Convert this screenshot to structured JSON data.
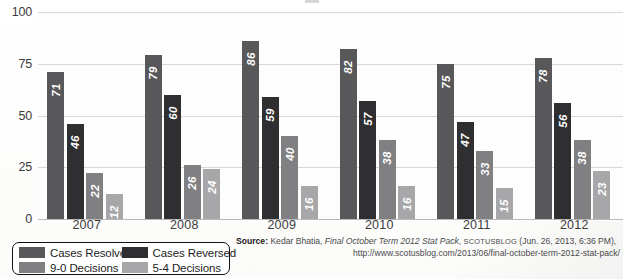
{
  "chart_data": {
    "type": "bar",
    "title": "",
    "xlabel": "",
    "ylabel": "",
    "ylim": [
      0,
      100
    ],
    "yticks": [
      0,
      25,
      50,
      75,
      100
    ],
    "grid": true,
    "legend_position": "bottom-left",
    "categories": [
      "2007",
      "2008",
      "2009",
      "2010",
      "2011",
      "2012"
    ],
    "series": [
      {
        "name": "Cases Resolved",
        "color": "#58585a",
        "values": [
          71,
          79,
          86,
          82,
          75,
          78
        ]
      },
      {
        "name": "Cases Reversed",
        "color": "#2f2f31",
        "values": [
          46,
          60,
          59,
          57,
          47,
          56
        ]
      },
      {
        "name": "9-0 Decisions",
        "color": "#808083",
        "values": [
          22,
          26,
          40,
          38,
          33,
          38
        ]
      },
      {
        "name": "5-4 Decisions",
        "color": "#a7a7a9",
        "values": [
          12,
          24,
          16,
          16,
          15,
          23
        ]
      }
    ]
  },
  "legend": {
    "items": [
      {
        "label": "Cases Resolved",
        "color": "#58585a"
      },
      {
        "label": "Cases Reversed",
        "color": "#2f2f31"
      },
      {
        "label": "9-0 Decisions",
        "color": "#808083"
      },
      {
        "label": "5-4 Decisions",
        "color": "#a7a7a9"
      }
    ]
  },
  "source": {
    "prefix": "Source:",
    "author": "Kedar Bhatia,",
    "work": "Final October Term 2012 Stat Pack",
    "publication": "SCOTUSBLOG",
    "date": "(Jun. 26, 2013, 6:36 PM),",
    "url": "http://www.scotusblog.com/2013/06/final-october-term-2012-stat-pack/"
  }
}
